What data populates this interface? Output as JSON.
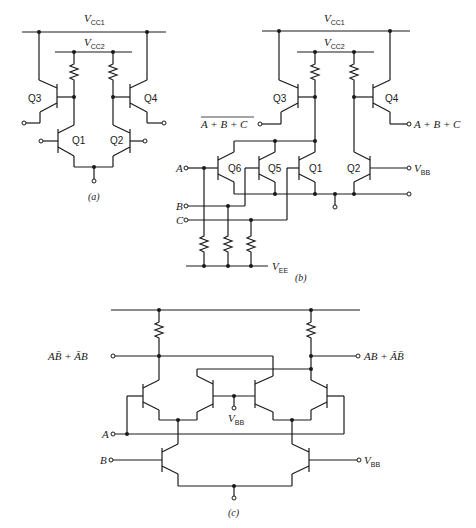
{
  "figure": {
    "a": {
      "caption": "(a)",
      "supply1": {
        "v": "V",
        "sub": "CC1"
      },
      "supply2": {
        "v": "V",
        "sub": "CC2"
      },
      "transistors": [
        "Q3",
        "Q4",
        "Q1",
        "Q2"
      ]
    },
    "b": {
      "caption": "(b)",
      "supply1": {
        "v": "V",
        "sub": "CC1"
      },
      "supply2": {
        "v": "V",
        "sub": "CC2"
      },
      "vee": {
        "v": "V",
        "sub": "EE"
      },
      "vbb": {
        "v": "V",
        "sub": "BB"
      },
      "transistors": [
        "Q3",
        "Q4",
        "Q6",
        "Q5",
        "Q1",
        "Q2"
      ],
      "inputs": [
        "A",
        "B",
        "C"
      ],
      "output_nor": "A + B + C",
      "output_or": "A + B + C"
    },
    "c": {
      "caption": "(c)",
      "vbb_mid": {
        "v": "V",
        "sub": "BB"
      },
      "vbb_right": {
        "v": "V",
        "sub": "BB"
      },
      "inputs": [
        "A",
        "B"
      ],
      "output_left": "AB̄ + ĀB",
      "output_right": "AB + ĀB̄"
    }
  }
}
